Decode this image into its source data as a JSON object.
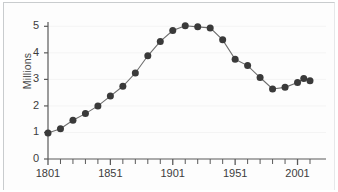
{
  "chart_data": {
    "type": "line",
    "title": "",
    "subtitle": "",
    "xlabel": "",
    "ylabel": "Millions",
    "xlim": [
      1801,
      2011
    ],
    "ylim": [
      0,
      5.2
    ],
    "grid": true,
    "grid_orientation": "horizontal",
    "legend": false,
    "legend_position": "none",
    "marker": "circle",
    "marker_color": "#3a3a3a",
    "line_color": "#6e6e6e",
    "y_ticks": [
      "0",
      "1",
      "2",
      "3",
      "4",
      "5"
    ],
    "y_tick_values": [
      0,
      1,
      2,
      3,
      4,
      5
    ],
    "x_ticks": [
      "1801",
      "1851",
      "1901",
      "1951",
      "2001"
    ],
    "x_tick_values": [
      1801,
      1851,
      1901,
      1951,
      2001
    ],
    "x_minor_tick_step": 10,
    "x": [
      1801,
      1811,
      1821,
      1831,
      1841,
      1851,
      1861,
      1871,
      1881,
      1891,
      1901,
      1911,
      1921,
      1931,
      1941,
      1951,
      1961,
      1971,
      1981,
      1991,
      2001,
      2006,
      2011
    ],
    "values": [
      0.98,
      1.14,
      1.46,
      1.71,
      2.0,
      2.37,
      2.74,
      3.24,
      3.89,
      4.43,
      4.84,
      5.02,
      4.98,
      4.94,
      4.49,
      3.76,
      3.52,
      3.07,
      2.64,
      2.7,
      2.88,
      3.03,
      2.95
    ],
    "series": [
      {
        "name": "Population",
        "values": [
          0.98,
          1.14,
          1.46,
          1.71,
          2.0,
          2.37,
          2.74,
          3.24,
          3.89,
          4.43,
          4.84,
          5.02,
          4.98,
          4.94,
          4.49,
          3.76,
          3.52,
          3.07,
          2.64,
          2.7,
          2.88,
          3.03,
          2.95
        ]
      }
    ],
    "annotations": []
  }
}
